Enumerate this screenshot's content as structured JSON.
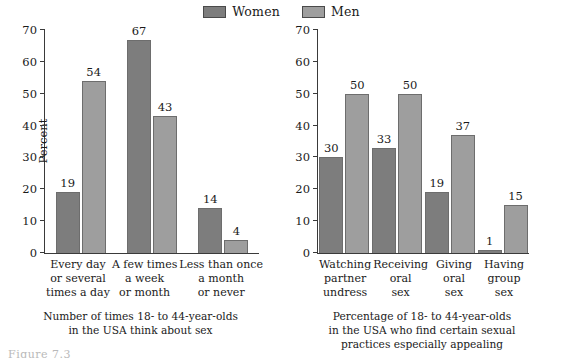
{
  "legend": {
    "entries": [
      {
        "label": "Women",
        "color": "#7d7d7d"
      },
      {
        "label": "Men",
        "color": "#9e9e9e"
      }
    ]
  },
  "figure_caption": "Figure 7.3",
  "panels": [
    {
      "id": "think-about-sex",
      "ylabel": "Percent",
      "caption_lines": [
        "Number of times 18- to 44-year-olds",
        "in the USA think about sex"
      ],
      "yticks": [
        0,
        10,
        20,
        30,
        40,
        50,
        60,
        70
      ],
      "categories": [
        [
          "Every day",
          "or several",
          "times a day"
        ],
        [
          "A few times",
          "a week",
          "or month"
        ],
        [
          "Less than once",
          "a month",
          "or never"
        ]
      ],
      "women": [
        19,
        67,
        14
      ],
      "men": [
        54,
        43,
        4
      ]
    },
    {
      "id": "appealing-practices",
      "ylabel": "",
      "caption_lines": [
        "Percentage of 18- to 44-year-olds",
        "in the USA who find certain sexual",
        "practices especially appealing"
      ],
      "yticks": [
        0,
        10,
        20,
        30,
        40,
        50,
        60,
        70
      ],
      "categories": [
        [
          "Watching",
          "partner",
          "undress"
        ],
        [
          "Receiving",
          "oral",
          "sex"
        ],
        [
          "Giving",
          "oral",
          "sex"
        ],
        [
          "Having",
          "group",
          "sex"
        ]
      ],
      "women": [
        30,
        33,
        19,
        1
      ],
      "men": [
        50,
        50,
        37,
        15
      ]
    }
  ],
  "chart_data": [
    {
      "type": "bar",
      "title": "Number of times 18- to 44-year-olds in the USA think about sex",
      "xlabel": "",
      "ylabel": "Percent",
      "ylim": [
        0,
        70
      ],
      "ytick_step": 10,
      "grid": false,
      "legend_position": "top-center",
      "categories": [
        "Every day or several times a day",
        "A few times a week or month",
        "Less than once a month or never"
      ],
      "series": [
        {
          "name": "Women",
          "values": [
            19,
            67,
            14
          ],
          "color": "#7d7d7d"
        },
        {
          "name": "Men",
          "values": [
            54,
            43,
            4
          ],
          "color": "#9e9e9e"
        }
      ]
    },
    {
      "type": "bar",
      "title": "Percentage of 18- to 44-year-olds in the USA who find certain sexual practices especially appealing",
      "xlabel": "",
      "ylabel": "Percent",
      "ylim": [
        0,
        70
      ],
      "ytick_step": 10,
      "grid": false,
      "legend_position": "top-center",
      "categories": [
        "Watching partner undress",
        "Receiving oral sex",
        "Giving oral sex",
        "Having group sex"
      ],
      "series": [
        {
          "name": "Women",
          "values": [
            30,
            33,
            19,
            1
          ],
          "color": "#7d7d7d"
        },
        {
          "name": "Men",
          "values": [
            50,
            50,
            37,
            15
          ],
          "color": "#9e9e9e"
        }
      ]
    }
  ]
}
